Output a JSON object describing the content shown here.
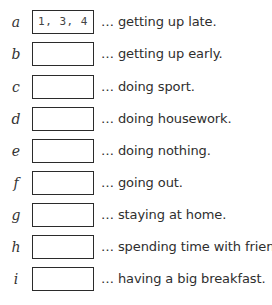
{
  "exercise": {
    "items": [
      {
        "letter": "a",
        "answer": "1, 3, 4",
        "phrase": "… getting up late."
      },
      {
        "letter": "b",
        "answer": "",
        "phrase": "… getting up early."
      },
      {
        "letter": "c",
        "answer": "",
        "phrase": "… doing sport."
      },
      {
        "letter": "d",
        "answer": "",
        "phrase": "… doing housework."
      },
      {
        "letter": "e",
        "answer": "",
        "phrase": "… doing nothing."
      },
      {
        "letter": "f",
        "answer": "",
        "phrase": "… going out."
      },
      {
        "letter": "g",
        "answer": "",
        "phrase": "… staying at home."
      },
      {
        "letter": "h",
        "answer": "",
        "phrase": "… spending time with friends."
      },
      {
        "letter": "i",
        "answer": "",
        "phrase": "… having a big breakfast."
      }
    ]
  }
}
